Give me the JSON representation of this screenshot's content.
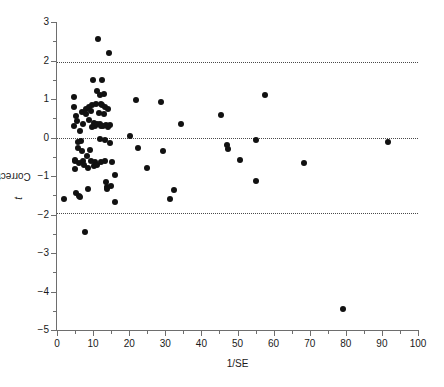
{
  "figure": {
    "top_caption": "",
    "background": "#ffffff",
    "point_color": "#111111",
    "axis_color": "#6e6e6e"
  },
  "axes": {
    "x_title": "1/SE",
    "y_title_prefix": "Corrected-",
    "y_title_italic": "t",
    "x_ticks": [
      "0",
      "10",
      "20",
      "30",
      "40",
      "50",
      "60",
      "70",
      "80",
      "90",
      "100"
    ],
    "y_ticks": [
      "3",
      "2",
      "1",
      "0",
      "−1",
      "−2",
      "−3",
      "−4",
      "−5"
    ]
  },
  "chart_data": {
    "type": "scatter",
    "title": "",
    "xlabel": "1/SE",
    "ylabel": "Corrected-t",
    "xlim": [
      0,
      100
    ],
    "ylim": [
      -5,
      3
    ],
    "xticks": [
      0,
      10,
      20,
      30,
      40,
      50,
      60,
      70,
      80,
      90,
      100
    ],
    "yticks": [
      3,
      2,
      1,
      0,
      -1,
      -2,
      -3,
      -4,
      -5
    ],
    "x_minor_step": 5,
    "y_minor_step": 0.5,
    "grid": false,
    "legend": "none",
    "marker": {
      "shape": "circle",
      "filled": true,
      "color": "#111111",
      "size_px": 6
    },
    "reference_lines": [
      {
        "type": "hline",
        "y": 1.96,
        "style": "dotted",
        "color": "#4a4a4a"
      },
      {
        "type": "hline",
        "y": 0.0,
        "style": "dotted",
        "color": "#4a4a4a"
      },
      {
        "type": "hline",
        "y": -1.96,
        "style": "dotted",
        "color": "#4a4a4a"
      }
    ],
    "points": [
      [
        1.9,
        -1.61
      ],
      [
        4.6,
        1.04
      ],
      [
        4.7,
        0.79
      ],
      [
        4.8,
        0.29
      ],
      [
        5.0,
        -0.62
      ],
      [
        5.0,
        -0.82
      ],
      [
        5.1,
        -0.58
      ],
      [
        5.2,
        0.57
      ],
      [
        5.3,
        -1.45
      ],
      [
        5.6,
        0.43
      ],
      [
        5.7,
        -0.12
      ],
      [
        5.9,
        -0.28
      ],
      [
        6.0,
        -0.66
      ],
      [
        6.2,
        -1.52
      ],
      [
        6.3,
        -1.54
      ],
      [
        6.4,
        0.18
      ],
      [
        6.6,
        -0.09
      ],
      [
        6.8,
        0.66
      ],
      [
        7.0,
        -0.36
      ],
      [
        7.1,
        -0.62
      ],
      [
        7.3,
        0.35
      ],
      [
        7.6,
        -0.71
      ],
      [
        7.8,
        -2.45
      ],
      [
        8.0,
        0.73
      ],
      [
        8.1,
        0.62
      ],
      [
        8.3,
        -0.49
      ],
      [
        8.5,
        -0.8
      ],
      [
        8.6,
        -1.35
      ],
      [
        8.9,
        0.46
      ],
      [
        9.0,
        0.8
      ],
      [
        9.2,
        -0.33
      ],
      [
        9.3,
        0.68
      ],
      [
        9.5,
        -0.62
      ],
      [
        9.6,
        0.26
      ],
      [
        9.8,
        0.84
      ],
      [
        10.0,
        1.5
      ],
      [
        10.2,
        -0.74
      ],
      [
        10.3,
        0.37
      ],
      [
        10.4,
        0.3
      ],
      [
        10.6,
        -0.63
      ],
      [
        10.8,
        0.88
      ],
      [
        11.0,
        1.2
      ],
      [
        11.1,
        -0.72
      ],
      [
        11.2,
        0.34
      ],
      [
        11.4,
        2.55
      ],
      [
        11.6,
        0.63
      ],
      [
        11.8,
        1.1
      ],
      [
        11.9,
        0.35
      ],
      [
        12.0,
        -0.05
      ],
      [
        12.1,
        0.87
      ],
      [
        12.2,
        0.3
      ],
      [
        12.3,
        -0.64
      ],
      [
        12.4,
        1.5
      ],
      [
        12.6,
        0.85
      ],
      [
        12.8,
        0.31
      ],
      [
        13.0,
        1.14
      ],
      [
        13.1,
        0.62
      ],
      [
        13.2,
        -0.07
      ],
      [
        13.3,
        0.78
      ],
      [
        13.4,
        -0.62
      ],
      [
        13.5,
        -1.16
      ],
      [
        13.7,
        0.32
      ],
      [
        13.8,
        -1.28
      ],
      [
        13.9,
        -1.33
      ],
      [
        14.0,
        0.75
      ],
      [
        14.2,
        0.28
      ],
      [
        14.4,
        2.2
      ],
      [
        14.6,
        -0.15
      ],
      [
        14.8,
        0.33
      ],
      [
        15.0,
        -1.25
      ],
      [
        15.2,
        -0.63
      ],
      [
        16.0,
        -0.98
      ],
      [
        16.2,
        -1.67
      ],
      [
        20.2,
        0.03
      ],
      [
        21.8,
        0.98
      ],
      [
        22.4,
        -0.26
      ],
      [
        25.0,
        -0.8
      ],
      [
        28.8,
        0.93
      ],
      [
        29.4,
        -0.34
      ],
      [
        31.4,
        -1.6
      ],
      [
        32.5,
        -1.36
      ],
      [
        34.4,
        0.35
      ],
      [
        45.3,
        0.59
      ],
      [
        47.1,
        -0.19
      ],
      [
        47.4,
        -0.29
      ],
      [
        50.8,
        -0.59
      ],
      [
        55.0,
        -0.07
      ],
      [
        55.2,
        -1.12
      ],
      [
        57.6,
        1.1
      ],
      [
        68.3,
        -0.67
      ],
      [
        79.2,
        -4.45
      ],
      [
        91.8,
        -0.11
      ]
    ]
  }
}
